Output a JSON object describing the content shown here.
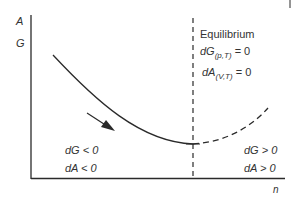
{
  "axes": {
    "y_labels": [
      "A",
      "G"
    ],
    "x_label": "n"
  },
  "equilibrium": {
    "title": "Equilibrium",
    "eq1": {
      "var": "dG",
      "sub": "(p,T)",
      "rhs": "= 0"
    },
    "eq2": {
      "var": "dA",
      "sub": "(V,T)",
      "rhs": "= 0"
    }
  },
  "left_region": {
    "line1": "dG < 0",
    "line2": "dA < 0"
  },
  "right_region": {
    "line1": "dG > 0",
    "line2": "dA > 0"
  },
  "colors": {
    "line": "#2a2a2a",
    "text": "#333333",
    "background": "#ffffff"
  }
}
